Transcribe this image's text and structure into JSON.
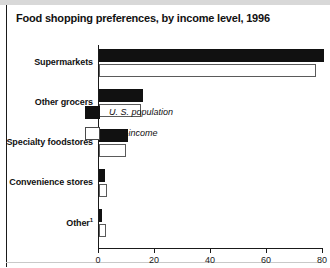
{
  "figure": {
    "title": "Food shopping preferences, by income level, 1996"
  },
  "legend": {
    "position": "inside-plot-middle",
    "entries": [
      {
        "label": "U. S. population",
        "swatch": "black-filled-square",
        "color": "#111111"
      },
      {
        "label": "Low-income",
        "swatch": "white-outlined-square",
        "color": "#ffffff"
      }
    ]
  },
  "axis": {
    "x_ticks": [
      "0",
      "20",
      "40",
      "60",
      "80"
    ]
  },
  "chart_data": {
    "type": "bar",
    "orientation": "horizontal",
    "title": "Food shopping preferences, by income level, 1996",
    "xlabel": "",
    "ylabel": "",
    "xlim": [
      0,
      80
    ],
    "grid": false,
    "legend_position": "center-right inside plot",
    "categories": [
      "Supermarkets",
      "Other grocers",
      "Specialty foodstores",
      "Convenience stores",
      "Other"
    ],
    "category_footnote_markers": [
      "",
      "",
      "",
      "",
      "1"
    ],
    "series": [
      {
        "name": "U. S. population",
        "color": "#111111",
        "values": [
          80.5,
          15.8,
          10.5,
          2.2,
          1.0
        ]
      },
      {
        "name": "Low-income",
        "color": "#ffffff",
        "values": [
          77.5,
          15.0,
          9.5,
          3.0,
          2.5
        ]
      }
    ]
  }
}
